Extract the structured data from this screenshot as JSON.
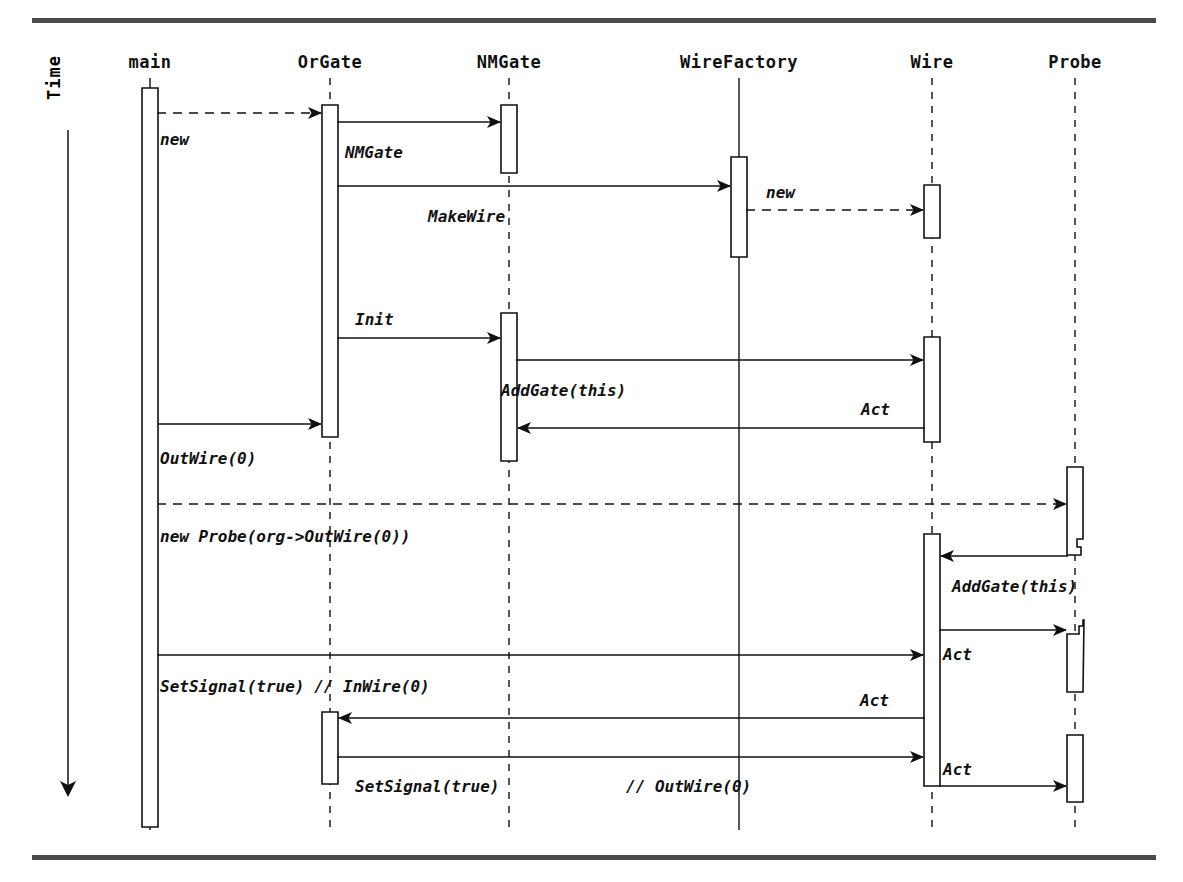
{
  "diagram": {
    "type": "sequence-diagram",
    "time_axis_label": "Time",
    "lifelines": [
      {
        "id": "main",
        "label": "main",
        "x": 150,
        "head_y": 68,
        "line_style": "solid"
      },
      {
        "id": "orgate",
        "label": "OrGate",
        "x": 330,
        "head_y": 68,
        "line_style": "dashed"
      },
      {
        "id": "nmgate",
        "label": "NMGate",
        "x": 509,
        "head_y": 68,
        "line_style": "dashed"
      },
      {
        "id": "wirefactory",
        "label": "WireFactory",
        "x": 739,
        "head_y": 68,
        "line_style": "solid"
      },
      {
        "id": "wire",
        "label": "Wire",
        "x": 932,
        "head_y": 68,
        "line_style": "dashed"
      },
      {
        "id": "probe",
        "label": "Probe",
        "x": 1075,
        "head_y": 68,
        "line_style": "dashed"
      }
    ],
    "activations": [
      {
        "lifeline": "main",
        "x": 150,
        "y": 88,
        "height": 739,
        "notch": "none"
      },
      {
        "lifeline": "orgate",
        "x": 330,
        "y": 105,
        "height": 332,
        "notch": "none"
      },
      {
        "lifeline": "orgate",
        "x": 330,
        "y": 712,
        "height": 72,
        "notch": "none"
      },
      {
        "lifeline": "nmgate",
        "x": 509,
        "y": 105,
        "height": 68,
        "notch": "none"
      },
      {
        "lifeline": "nmgate",
        "x": 509,
        "y": 313,
        "height": 148,
        "notch": "none"
      },
      {
        "lifeline": "wirefactory",
        "x": 739,
        "y": 157,
        "height": 100,
        "notch": "none"
      },
      {
        "lifeline": "wire",
        "x": 932,
        "y": 185,
        "height": 53,
        "notch": "none"
      },
      {
        "lifeline": "wire",
        "x": 932,
        "y": 337,
        "height": 105,
        "notch": "none"
      },
      {
        "lifeline": "wire",
        "x": 932,
        "y": 534,
        "height": 252,
        "notch": "none"
      },
      {
        "lifeline": "probe",
        "x": 1075,
        "y": 467,
        "height": 88,
        "notch": "bottom"
      },
      {
        "lifeline": "probe",
        "x": 1075,
        "y": 620,
        "height": 72,
        "notch": "top"
      },
      {
        "lifeline": "probe",
        "x": 1075,
        "y": 735,
        "height": 67,
        "notch": "none"
      }
    ],
    "messages": [
      {
        "label": "new",
        "from": "main",
        "to": "orgate",
        "y": 113,
        "style": "dashed",
        "dir": "right",
        "label_x": 160,
        "label_y": 145
      },
      {
        "label": "NMGate",
        "from": "orgate",
        "to": "nmgate",
        "y": 122,
        "style": "solid",
        "dir": "right",
        "label_x": 345,
        "label_y": 158
      },
      {
        "label": "MakeWire",
        "from": "orgate",
        "to": "wirefactory",
        "y": 186,
        "style": "solid",
        "dir": "right",
        "label_x": 428,
        "label_y": 222
      },
      {
        "label": "new",
        "from": "wirefactory",
        "to": "wire",
        "y": 210,
        "style": "dashed",
        "dir": "right",
        "label_x": 766,
        "label_y": 198
      },
      {
        "label": "Init",
        "from": "orgate",
        "to": "nmgate",
        "y": 338,
        "style": "solid",
        "dir": "right",
        "label_x": 355,
        "label_y": 325
      },
      {
        "label": "AddGate(this)",
        "from": "nmgate",
        "to": "wire",
        "y": 360,
        "style": "solid",
        "dir": "right",
        "label_x": 501,
        "label_y": 396
      },
      {
        "label": "Act",
        "from": "wire",
        "to": "nmgate",
        "y": 428,
        "style": "solid",
        "dir": "left",
        "label_x": 861,
        "label_y": 415
      },
      {
        "label": "OutWire(0)",
        "from": "main",
        "to": "orgate",
        "y": 424,
        "style": "solid",
        "dir": "right",
        "label_x": 160,
        "label_y": 464
      },
      {
        "label": "new Probe(org->OutWire(0))",
        "from": "main",
        "to": "probe",
        "y": 504,
        "style": "dashed",
        "dir": "right",
        "label_x": 160,
        "label_y": 542
      },
      {
        "label": "AddGate(this)",
        "from": "probe",
        "to": "wire",
        "y": 556,
        "style": "solid",
        "dir": "left",
        "label_x": 952,
        "label_y": 592
      },
      {
        "label": "Act",
        "from": "wire",
        "to": "probe",
        "y": 630,
        "style": "solid",
        "dir": "right",
        "label_x": 943,
        "label_y": 660
      },
      {
        "label": "SetSignal(true)  // InWire(0)",
        "from": "main",
        "to": "wire",
        "y": 655,
        "style": "solid",
        "dir": "right",
        "label_x": 160,
        "label_y": 692
      },
      {
        "label": "Act",
        "from": "wire",
        "to": "orgate",
        "y": 718,
        "style": "solid",
        "dir": "left",
        "label_x": 860,
        "label_y": 706
      },
      {
        "label": "SetSignal(true)",
        "from": "orgate",
        "to": "wire",
        "y": 757,
        "style": "solid",
        "dir": "right",
        "label_x": 355,
        "label_y": 792
      },
      {
        "label": "// OutWire(0)",
        "from": "",
        "to": "",
        "y": 0,
        "style": "none",
        "dir": "none",
        "label_x": 626,
        "label_y": 792
      },
      {
        "label": "Act",
        "from": "wire",
        "to": "probe",
        "y": 786,
        "style": "solid",
        "dir": "right",
        "label_x": 943,
        "label_y": 775
      }
    ],
    "frame": {
      "top_rule_y": 18,
      "top_rule_x": 32,
      "top_rule_width": 1124,
      "bottom_rule_y": 855,
      "bottom_rule_x": 32,
      "bottom_rule_width": 1124,
      "rule_color": "#4a4a4a"
    },
    "time_arrow": {
      "x": 68,
      "y_start": 130,
      "y_end": 800,
      "label_x": 68,
      "label_y": 120
    }
  }
}
